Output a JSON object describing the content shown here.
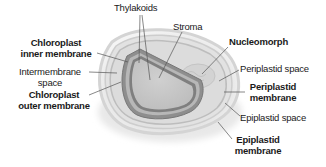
{
  "diagram": {
    "type": "labeled-organelle-cross-section",
    "palette": {
      "background": "#ffffff",
      "text": "#1a1a1a",
      "leader_line": "#555555",
      "outer_halo": "#e6e6e6",
      "epiplastid_membrane": "#cfcfcf",
      "periplastid_region": "#dcdcdc",
      "chloroplast_outer_membrane": "#8a8a8a",
      "chloroplast_inner_membrane": "#7a7a7a",
      "intermembrane_space": "#b5b5b5",
      "stroma": "#c8c8c8",
      "nucleomorph": "#d2d2d2"
    },
    "labels": {
      "thylakoids": "Thylakoids",
      "stroma": "Stroma",
      "chloroplast_inner_membrane": {
        "line1": "Chloroplast",
        "line2": "inner membrane"
      },
      "intermembrane_space": {
        "line1": "Intermembrane",
        "line2": "space"
      },
      "chloroplast_outer_membrane": {
        "line1": "Chloroplast",
        "line2": "outer membrane"
      },
      "nucleomorph": "Nucleomorph",
      "periplastid_space": "Periplastid space",
      "periplastid_membrane": {
        "line1": "Periplastid",
        "line2": "membrane"
      },
      "epiplastid_space": "Epiplastid space",
      "epiplastid_membrane": {
        "line1": "Epiplastid",
        "line2": "membrane"
      }
    }
  }
}
